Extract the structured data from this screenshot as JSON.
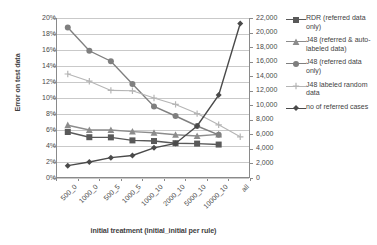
{
  "chart_data": {
    "type": "line",
    "title": "",
    "xlabel": "initial treatment (initial_initial per rule)",
    "ylabel": "Error on test data",
    "ylabel_right": "",
    "categories": [
      "500_0",
      "1000_0",
      "500_5",
      "1000_5",
      "1000_10",
      "2000_10",
      "5000_10",
      "10000_10",
      "all"
    ],
    "ylim": [
      0,
      0.2
    ],
    "yticks": [
      "0%",
      "2%",
      "4%",
      "6%",
      "8%",
      "10%",
      "12%",
      "14%",
      "16%",
      "18%",
      "20%"
    ],
    "ylim_right": [
      0,
      22000
    ],
    "yticks_right": [
      "0",
      "2,000",
      "4,000",
      "6,000",
      "8,000",
      "10,000",
      "12,000",
      "14,000",
      "16,000",
      "18,000",
      "20,000",
      "22,000"
    ],
    "grid": true,
    "legend_position": "right",
    "series": [
      {
        "name": "RDR (referred data only)",
        "axis": "left",
        "color": "#595959",
        "marker": "square",
        "values": [
          0.0575,
          0.051,
          0.0508,
          0.047,
          0.0462,
          0.0435,
          0.043,
          0.0418,
          null
        ]
      },
      {
        "name": "J48 (referred & auto-labeled data)",
        "axis": "left",
        "color": "#8c8c8c",
        "marker": "triangle",
        "values": [
          0.066,
          0.06,
          0.06,
          0.058,
          0.0565,
          0.054,
          0.0525,
          0.0545,
          null
        ]
      },
      {
        "name": "J48 (referred data only)",
        "axis": "left",
        "color": "#7f7f7f",
        "marker": "circle",
        "values": [
          0.188,
          0.159,
          0.146,
          0.1175,
          0.0895,
          0.0775,
          0.065,
          0.054,
          null
        ]
      },
      {
        "name": "J48 labeled random data",
        "axis": "left",
        "color": "#b5b5b5",
        "marker": "plus",
        "values": [
          0.13,
          0.121,
          0.1095,
          0.109,
          0.1,
          0.092,
          0.0805,
          0.0665,
          0.0515
        ]
      },
      {
        "name": "no of referred cases",
        "axis": "right",
        "color": "#4a4a4a",
        "marker": "diamond",
        "values": [
          1700,
          2200,
          2800,
          3100,
          4150,
          4750,
          7150,
          11400,
          21250
        ]
      }
    ]
  },
  "legend": {
    "items": [
      {
        "label": "RDR (referred data only)"
      },
      {
        "label": "J48 (referred & auto-labeled data)"
      },
      {
        "label": "J48 (referred data only)"
      },
      {
        "label": "J48 labeled random data"
      },
      {
        "label": "no of referred cases"
      }
    ]
  }
}
